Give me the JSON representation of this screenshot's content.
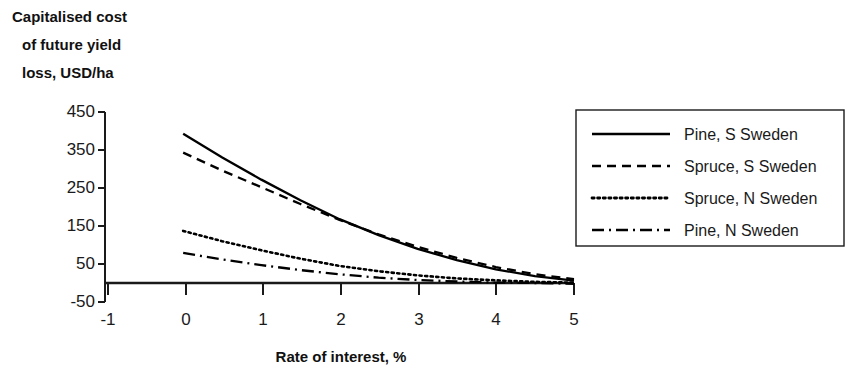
{
  "chart_data": {
    "type": "line",
    "title": "",
    "ylabel_lines": [
      "Capitalised cost",
      "of future yield",
      "loss, USD/ha"
    ],
    "ylabel": "Capitalised cost of future yield loss, USD/ha",
    "xlabel": "Rate of interest, %",
    "xlim": [
      -1,
      5
    ],
    "ylim": [
      -50,
      450
    ],
    "xticks": [
      "-1",
      "0",
      "1",
      "2",
      "3",
      "4",
      "5"
    ],
    "xtick_values": [
      -1,
      0,
      1,
      2,
      3,
      4,
      5
    ],
    "yticks": [
      "-50",
      "50",
      "150",
      "250",
      "350",
      "450"
    ],
    "ytick_values": [
      -50,
      50,
      150,
      250,
      350,
      450
    ],
    "grid": false,
    "legend_position": "right",
    "x": [
      0,
      0.5,
      1,
      1.5,
      2,
      2.5,
      3,
      3.5,
      4,
      4.5,
      5
    ],
    "series": [
      {
        "name": "Pine, S Sweden",
        "style": "solid",
        "color": "#000000",
        "values": [
          393,
          330,
          272,
          218,
          168,
          126,
          90,
          60,
          36,
          18,
          6
        ]
      },
      {
        "name": "Spruce, S Sweden",
        "style": "dashed",
        "color": "#000000",
        "values": [
          343,
          296,
          252,
          208,
          166,
          128,
          95,
          66,
          42,
          23,
          10
        ]
      },
      {
        "name": "Spruce, N Sweden",
        "style": "dotted",
        "color": "#000000",
        "values": [
          137,
          110,
          86,
          64,
          45,
          31,
          20,
          12,
          7,
          3,
          1
        ]
      },
      {
        "name": "Pine, N Sweden",
        "style": "dashdot",
        "color": "#000000",
        "values": [
          79,
          62,
          47,
          34,
          23,
          14,
          8,
          4,
          1,
          0,
          -2
        ]
      }
    ]
  },
  "legend": {
    "items": [
      {
        "label": "Pine, S Sweden",
        "style": "solid"
      },
      {
        "label": "Spruce, S Sweden",
        "style": "dashed"
      },
      {
        "label": "Spruce, N Sweden",
        "style": "dotted"
      },
      {
        "label": "Pine, N Sweden",
        "style": "dashdot"
      }
    ]
  }
}
